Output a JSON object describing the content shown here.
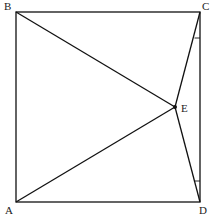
{
  "diagram": {
    "type": "geometry",
    "points": {
      "A": {
        "label": "A",
        "x": 16,
        "y": 202
      },
      "B": {
        "label": "B",
        "x": 16,
        "y": 12
      },
      "C": {
        "label": "C",
        "x": 200,
        "y": 12
      },
      "D": {
        "label": "D",
        "x": 200,
        "y": 202
      },
      "E": {
        "label": "E",
        "x": 175,
        "y": 107
      }
    },
    "segments": [
      "AB",
      "BC",
      "CD",
      "DA",
      "BE",
      "AE",
      "CE",
      "DE"
    ],
    "angle_marks": [
      "ECD at C",
      "EDC at D"
    ],
    "colors": {
      "stroke": "#111111",
      "background": "#ffffff"
    }
  }
}
